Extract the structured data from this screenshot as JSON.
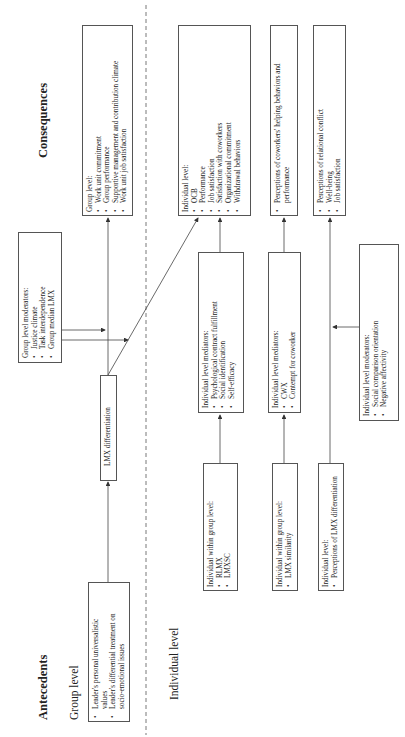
{
  "sections": {
    "antecedents": "Antecedents",
    "consequences": "Consequences",
    "group_level": "Group level",
    "individual_level": "Individual level"
  },
  "boxes": {
    "antecedent_group": {
      "items": [
        "Leader's personal universalistic",
        "values",
        "Leader's differential treatment on",
        "socio-emotional issues"
      ]
    },
    "lmx_differentiation": {
      "label": "LMX differentiation"
    },
    "group_moderators": {
      "header": "Group level moderators:",
      "items": [
        "Justice climate",
        "Task interdependence",
        "Group median LMX"
      ]
    },
    "group_consequences": {
      "header": "Group level:",
      "items": [
        "Work unit commitment",
        "Group performance",
        "Supportive management and contribution climate",
        "Work unit job satisfaction"
      ]
    },
    "individual_within_group_1": {
      "header": "Individual within group level:",
      "items": [
        "RLMX",
        "LMXSC"
      ]
    },
    "individual_within_group_2": {
      "header": "Individual within group level:",
      "items": [
        "LMX similarity"
      ]
    },
    "individual_level_antecedent": {
      "header": "Individual level:",
      "items": [
        "Perceptions of LMX differentiation"
      ]
    },
    "mediators_1": {
      "header": "Individual level mediators:",
      "items": [
        "Psychological contract fulfillment",
        "Social identification",
        "Self-efficacy"
      ]
    },
    "mediators_2": {
      "header": "Individual level mediators:",
      "items": [
        "CWX",
        "Contempt for coworker"
      ]
    },
    "individual_moderators": {
      "header": "Individual level moderators:",
      "items": [
        "Social comparison orientation",
        "Negative affectivity"
      ]
    },
    "individual_consequences": {
      "header": "Individual level:",
      "items": [
        "OCB",
        "Performance",
        "Job satisfaction",
        "Satisfaction with coworkers",
        "Organizational commitment",
        "Withdrawal behaviors"
      ]
    },
    "coworker_consequences": {
      "items": [
        "Perceptions of coworkers' helping behaviors and",
        "performance"
      ]
    },
    "conflict_consequences": {
      "items": [
        "Perceptions of relational conflict",
        "Well-being",
        "Job satisfaction"
      ]
    }
  },
  "colors": {
    "line": "#444444",
    "border": "#555555",
    "text": "#222222"
  }
}
